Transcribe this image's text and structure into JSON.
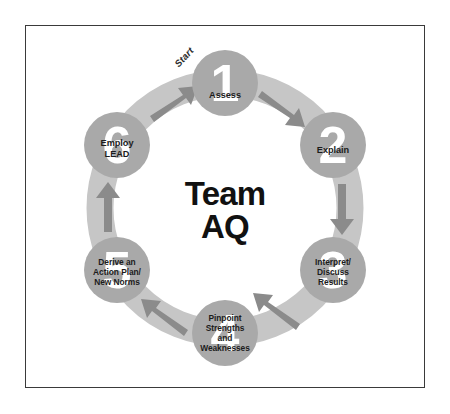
{
  "diagram": {
    "title": "Team\nAQ",
    "title_line1": "Team",
    "title_line2": "AQ",
    "start_label": "Start",
    "colors": {
      "frame_border": "#3a3a3a",
      "background": "#ffffff",
      "ring_band": "#c6c6c6",
      "node_circle": "#a9a9a9",
      "arrow": "#8b8b8b",
      "node_number": "#ffffff",
      "node_text": "#1c1c1c",
      "center_text": "#111111"
    },
    "geometry": {
      "center_x": 225,
      "center_y": 208,
      "ring_radius": 125,
      "ring_thickness": 27,
      "node_radius": 33
    },
    "nodes": [
      {
        "number": "1",
        "label": "Assess",
        "cx": 225,
        "cy": 83,
        "label_dy": 12,
        "font_size": 9.2
      },
      {
        "number": "2",
        "label": "Explain",
        "cx": 333,
        "cy": 145,
        "label_dy": 5,
        "font_size": 9.2
      },
      {
        "number": "3",
        "label": "Interpret/\nDiscuss\nResults",
        "cx": 333,
        "cy": 270,
        "label_dy": 2,
        "font_size": 8.4
      },
      {
        "number": "4",
        "label": "Pinpoint\nStrengths\nand\nWeaknesses",
        "cx": 225,
        "cy": 333,
        "label_dy": 0,
        "font_size": 8.4
      },
      {
        "number": "5",
        "label": "Derive an\nAction Plan/\nNew Norms",
        "cx": 117,
        "cy": 270,
        "label_dy": 2,
        "font_size": 8.4
      },
      {
        "number": "6",
        "label": "Employ\nLEAD",
        "cx": 117,
        "cy": 145,
        "label_dy": 4,
        "font_size": 9.2
      }
    ],
    "arrows": [
      {
        "from": "6",
        "to": "1",
        "name": "arrow-6-to-1"
      },
      {
        "from": "1",
        "to": "2",
        "name": "arrow-1-to-2"
      },
      {
        "from": "2",
        "to": "3",
        "name": "arrow-2-to-3"
      },
      {
        "from": "3",
        "to": "4",
        "name": "arrow-3-to-4"
      },
      {
        "from": "4",
        "to": "5",
        "name": "arrow-4-to-5"
      },
      {
        "from": "5",
        "to": "6",
        "name": "arrow-5-to-6"
      }
    ]
  }
}
